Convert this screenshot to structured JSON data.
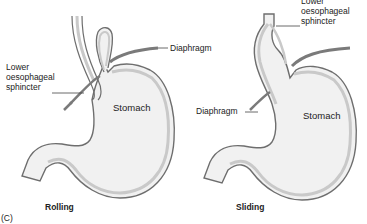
{
  "figure": {
    "panel_label": "(C)",
    "colors": {
      "wall_outer": "#6e6e6e",
      "wall_fill": "#c9c9c9",
      "lumen_fill": "#f1f1f1",
      "diaphragm": "#7a7a7a",
      "text": "#222222"
    }
  },
  "diagrams": [
    {
      "id": "rolling",
      "caption": "Rolling",
      "labels": {
        "diaphragm": "Diaphragm",
        "sphincter": "Lower\noesophageal\nsphincter",
        "stomach": "Stomach"
      }
    },
    {
      "id": "sliding",
      "caption": "Sliding",
      "labels": {
        "diaphragm": "Diaphragm",
        "sphincter": "Lower\noesophageal\nsphincter",
        "stomach": "Stomach"
      }
    }
  ]
}
